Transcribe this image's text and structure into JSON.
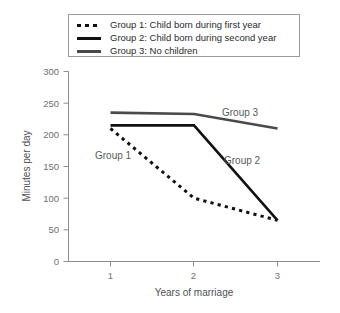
{
  "legend": {
    "entries": [
      {
        "label": "Group 1: Child born during first year",
        "style": "dotted",
        "color": "#111111"
      },
      {
        "label": "Group 2: Child born during second year",
        "style": "solid",
        "color": "#111111"
      },
      {
        "label": "Group 3: No children",
        "style": "solid",
        "color": "#4a4a4a"
      }
    ]
  },
  "annotations": {
    "group1": "Group 1",
    "group2": "Group 2",
    "group3": "Group 3"
  },
  "axes": {
    "y_ticks": [
      "300",
      "250",
      "200",
      "150",
      "100",
      "50",
      "0"
    ],
    "x_ticks": [
      "1",
      "2",
      "3"
    ],
    "ylabel": "Minutes per day",
    "xlabel": "Years of marriage"
  },
  "chart_data": {
    "type": "line",
    "title": "",
    "xlabel": "Years of marriage",
    "ylabel": "Minutes per day",
    "x": [
      1,
      2,
      3
    ],
    "xlim": [
      0.6,
      3.4
    ],
    "ylim": [
      0,
      300
    ],
    "yticks": [
      0,
      50,
      100,
      150,
      200,
      250,
      300
    ],
    "xticks": [
      1,
      2,
      3
    ],
    "grid": false,
    "legend_position": "top",
    "series": [
      {
        "name": "Group 1: Child born during first year",
        "short_name": "Group 1",
        "values": [
          210,
          100,
          65
        ],
        "linestyle": "dotted",
        "color": "#111111"
      },
      {
        "name": "Group 2: Child born during second year",
        "short_name": "Group 2",
        "values": [
          215,
          215,
          65
        ],
        "linestyle": "solid",
        "color": "#111111"
      },
      {
        "name": "Group 3: No children",
        "short_name": "Group 3",
        "values": [
          235,
          233,
          210
        ],
        "linestyle": "solid",
        "color": "#4a4a4a"
      }
    ]
  }
}
